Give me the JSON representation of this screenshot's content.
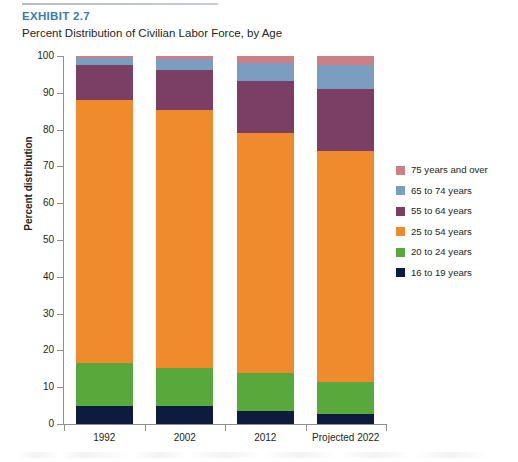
{
  "header": {
    "exhibit_label": "EXHIBIT 2.7",
    "title": "Percent Distribution of Civilian Labor Force, by Age"
  },
  "colors": {
    "exhibit_label": "#3a7ca8",
    "axis": "#8d9094",
    "text": "#231f20",
    "s75_over": "#cd7f86",
    "s65_74": "#7b9dbf",
    "s55_64": "#7b3f66",
    "s25_54": "#ef8b2c",
    "s20_24": "#59a83b",
    "s16_19": "#0d1b3e"
  },
  "legend": {
    "position": "right",
    "items": [
      {
        "label": "75 years and over",
        "color": "#cd7f86"
      },
      {
        "label": "65 to 74 years",
        "color": "#7b9dbf"
      },
      {
        "label": "55 to 64 years",
        "color": "#7b3f66"
      },
      {
        "label": "25 to 54 years",
        "color": "#ef8b2c"
      },
      {
        "label": "20 to 24 years",
        "color": "#59a83b"
      },
      {
        "label": "16 to 19 years",
        "color": "#0d1b3e"
      }
    ]
  },
  "axes": {
    "y_title": "Percent distribution",
    "y_ticks": [
      "0",
      "10",
      "20",
      "30",
      "40",
      "50",
      "60",
      "70",
      "80",
      "90",
      "100"
    ],
    "x_ticks": [
      "1992",
      "2002",
      "2012",
      "Projected 2022"
    ]
  },
  "chart_data": {
    "type": "bar",
    "stacked": true,
    "title": "Percent Distribution of Civilian Labor Force, by Age",
    "subtitle": "EXHIBIT 2.7",
    "xlabel": "",
    "ylabel": "Percent distribution",
    "ylim": [
      0,
      100
    ],
    "grid": false,
    "legend_position": "right",
    "categories": [
      "1992",
      "2002",
      "2012",
      "Projected 2022"
    ],
    "series": [
      {
        "name": "16 to 19 years",
        "color": "#0d1b3e",
        "values": [
          5.0,
          4.9,
          3.6,
          2.7
        ]
      },
      {
        "name": "20 to 24 years",
        "color": "#59a83b",
        "values": [
          11.5,
          10.3,
          10.2,
          8.6
        ]
      },
      {
        "name": "25 to 54 years",
        "color": "#ef8b2c",
        "values": [
          71.5,
          70.1,
          65.3,
          62.8
        ]
      },
      {
        "name": "55 to 64 years",
        "color": "#7b3f66",
        "values": [
          9.5,
          11.0,
          14.2,
          17.0
        ]
      },
      {
        "name": "65 to 74 years",
        "color": "#7b9dbf",
        "values": [
          2.0,
          3.0,
          4.8,
          6.5
        ]
      },
      {
        "name": "75 years and over",
        "color": "#cd7f86",
        "values": [
          0.5,
          0.7,
          1.9,
          2.4
        ]
      }
    ]
  }
}
